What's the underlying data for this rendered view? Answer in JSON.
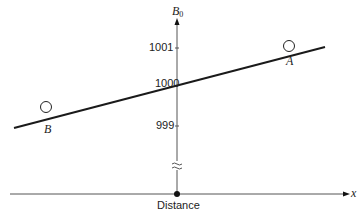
{
  "diagram": {
    "y_axis": {
      "label": "B",
      "label_subscript": "0",
      "ticks": [
        "1001",
        "1000",
        "999"
      ],
      "break_symbol": "≈"
    },
    "x_axis": {
      "label": "x",
      "caption": "Distance"
    },
    "points": [
      {
        "label": "A"
      },
      {
        "label": "B"
      }
    ],
    "colors": {
      "line": "#1a1a1a",
      "axis": "#555555",
      "background": "#ffffff"
    }
  }
}
